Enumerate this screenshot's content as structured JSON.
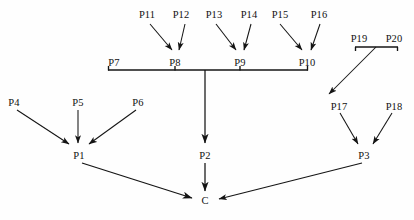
{
  "diagram": {
    "type": "directed-graph",
    "background_color": "#fefefe",
    "line_color": "#141414",
    "text_color": "#111111",
    "nodes": [
      {
        "id": "C",
        "label": "C",
        "x": 205,
        "y": 200,
        "role": "goal"
      },
      {
        "id": "P1",
        "label": "P1",
        "x": 79,
        "y": 155,
        "role": "intermediate"
      },
      {
        "id": "P2",
        "label": "P2",
        "x": 205,
        "y": 155,
        "role": "intermediate"
      },
      {
        "id": "P3",
        "label": "P3",
        "x": 364,
        "y": 155,
        "role": "intermediate"
      },
      {
        "id": "P4",
        "label": "P4",
        "x": 14,
        "y": 102,
        "role": "leaf"
      },
      {
        "id": "P5",
        "label": "P5",
        "x": 78,
        "y": 102,
        "role": "leaf"
      },
      {
        "id": "P6",
        "label": "P6",
        "x": 138,
        "y": 102,
        "role": "leaf"
      },
      {
        "id": "P7",
        "label": "P7",
        "x": 114,
        "y": 62,
        "role": "bar-endpoint"
      },
      {
        "id": "P8",
        "label": "P8",
        "x": 175,
        "y": 62,
        "role": "bar-endpoint"
      },
      {
        "id": "P9",
        "label": "P9",
        "x": 240,
        "y": 62,
        "role": "bar-endpoint"
      },
      {
        "id": "P10",
        "label": "P10",
        "x": 307,
        "y": 62,
        "role": "bar-endpoint"
      },
      {
        "id": "P11",
        "label": "P11",
        "x": 147,
        "y": 14,
        "role": "leaf"
      },
      {
        "id": "P12",
        "label": "P12",
        "x": 181,
        "y": 14,
        "role": "leaf"
      },
      {
        "id": "P13",
        "label": "P13",
        "x": 214,
        "y": 14,
        "role": "leaf"
      },
      {
        "id": "P14",
        "label": "P14",
        "x": 249,
        "y": 14,
        "role": "leaf"
      },
      {
        "id": "P15",
        "label": "P15",
        "x": 280,
        "y": 14,
        "role": "leaf"
      },
      {
        "id": "P16",
        "label": "P16",
        "x": 319,
        "y": 14,
        "role": "leaf"
      },
      {
        "id": "P17",
        "label": "P17",
        "x": 339,
        "y": 106,
        "role": "leaf"
      },
      {
        "id": "P18",
        "label": "P18",
        "x": 394,
        "y": 106,
        "role": "leaf"
      },
      {
        "id": "P19",
        "label": "P19",
        "x": 359,
        "y": 38,
        "role": "bar-endpoint"
      },
      {
        "id": "P20",
        "label": "P20",
        "x": 394,
        "y": 38,
        "role": "bar-endpoint"
      }
    ],
    "edges": [
      {
        "from": "P11",
        "to": "P8",
        "arrow": true
      },
      {
        "from": "P12",
        "to": "P8",
        "arrow": true
      },
      {
        "from": "P13",
        "to": "P9",
        "arrow": true
      },
      {
        "from": "P14",
        "to": "P9",
        "arrow": true
      },
      {
        "from": "P15",
        "to": "P10",
        "arrow": true
      },
      {
        "from": "P16",
        "to": "P10",
        "arrow": true
      },
      {
        "from": "P4",
        "to": "P1",
        "arrow": true
      },
      {
        "from": "P5",
        "to": "P1",
        "arrow": true
      },
      {
        "from": "P6",
        "to": "P1",
        "arrow": true
      },
      {
        "from": "P17",
        "to": "P3",
        "arrow": true
      },
      {
        "from": "P18",
        "to": "P3",
        "arrow": true
      },
      {
        "from": "bar-P7-P10",
        "to": "P2",
        "arrow": true
      },
      {
        "from": "bar-P19-P20",
        "to": "P17",
        "arrow": true
      },
      {
        "from": "P1",
        "to": "C",
        "arrow": true
      },
      {
        "from": "P2",
        "to": "C",
        "arrow": true
      },
      {
        "from": "P3",
        "to": "C",
        "arrow": true
      }
    ],
    "brackets": [
      {
        "id": "bar-P7-P10",
        "spans": [
          "P7",
          "P8",
          "P9",
          "P10"
        ],
        "x1": 108,
        "x2": 308,
        "y": 70,
        "drop_x": 205
      },
      {
        "id": "bar-P19-P20",
        "spans": [
          "P19",
          "P20"
        ],
        "x1": 355,
        "x2": 398,
        "y": 47,
        "drop_x": 376
      }
    ]
  }
}
